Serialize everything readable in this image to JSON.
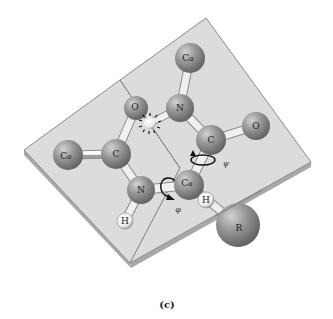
{
  "figure": {
    "caption": "(c)",
    "colors": {
      "plane_fill": "#dcdcdc",
      "plane_edge": "#8a8a8a",
      "plane_side": "#a8a8a8",
      "atom_fill": "#8c8c8c",
      "atom_highlight": "#c8c8c8",
      "hydrogen_fill": "#f4f4f4",
      "bond_fill": "#f2f2f2",
      "arrow": "#111111"
    },
    "atoms": [
      {
        "id": "calpha-left",
        "label_main": "C",
        "label_sub": "α",
        "x": 68,
        "y": 155,
        "r": 15
      },
      {
        "id": "carbon-left",
        "label_main": "C",
        "label_sub": "",
        "x": 116,
        "y": 154,
        "r": 15
      },
      {
        "id": "oxygen-left",
        "label_main": "O",
        "label_sub": "",
        "x": 136,
        "y": 108,
        "r": 12
      },
      {
        "id": "nitrogen-top",
        "label_main": "N",
        "label_sub": "",
        "x": 180,
        "y": 108,
        "r": 14
      },
      {
        "id": "calpha-top",
        "label_main": "C",
        "label_sub": "α",
        "x": 190,
        "y": 58,
        "r": 15
      },
      {
        "id": "carbon-right",
        "label_main": "C",
        "label_sub": "",
        "x": 211,
        "y": 140,
        "r": 15
      },
      {
        "id": "oxygen-right",
        "label_main": "O",
        "label_sub": "",
        "x": 256,
        "y": 126,
        "r": 14
      },
      {
        "id": "nitrogen-bottom",
        "label_main": "N",
        "label_sub": "",
        "x": 141,
        "y": 190,
        "r": 14
      },
      {
        "id": "calpha-center",
        "label_main": "C",
        "label_sub": "α",
        "x": 189,
        "y": 185,
        "r": 15
      },
      {
        "id": "hydrogen-n",
        "label_main": "H",
        "label_sub": "",
        "x": 125,
        "y": 221,
        "r": 8
      },
      {
        "id": "hydrogen-calpha",
        "label_main": "H",
        "label_sub": "",
        "x": 206,
        "y": 200,
        "r": 8
      },
      {
        "id": "r-group",
        "label_main": "R",
        "label_sub": "",
        "x": 238,
        "y": 225,
        "r": 22
      }
    ],
    "torsion_labels": {
      "phi": "φ",
      "psi": "ψ"
    },
    "steric_clash": {
      "description": "O···H clash marker",
      "x": 150,
      "y": 123
    }
  }
}
